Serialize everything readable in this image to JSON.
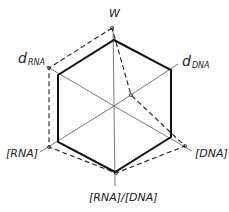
{
  "diagram": {
    "type": "hexagonal-radar",
    "center": [
      114,
      106
    ],
    "axes": [
      {
        "id": "w",
        "label": "W",
        "sub": "",
        "end": [
          113,
          26
        ],
        "hex": [
          114,
          40
        ],
        "dashed": [
          112,
          28
        ],
        "label_pos": [
          109,
          17
        ]
      },
      {
        "id": "d_dna",
        "label": "d",
        "sub": "DNA",
        "end": [
          178,
          64
        ],
        "hex": [
          171,
          70
        ],
        "dashed": [
          131,
          95
        ],
        "label_pos": [
          182,
          66
        ]
      },
      {
        "id": "dna",
        "label": "[DNA]",
        "sub": "",
        "end": [
          192,
          151
        ],
        "hex": [
          171,
          137
        ],
        "dashed": [
          185,
          146
        ],
        "label_pos": [
          195,
          157
        ]
      },
      {
        "id": "rna_dna",
        "label": "[RNA]/[DNA]",
        "sub": "",
        "end": [
          115,
          186
        ],
        "hex": [
          115,
          172
        ],
        "dashed": [
          116,
          173
        ],
        "label_pos": [
          89,
          201
        ]
      },
      {
        "id": "rna",
        "label": "[RNA]",
        "sub": "",
        "end": [
          40,
          152
        ],
        "hex": [
          58,
          142
        ],
        "dashed": [
          49,
          147
        ],
        "label_pos": [
          6,
          157
        ]
      },
      {
        "id": "d_rna",
        "label": "d",
        "sub": "RNA",
        "end": [
          46,
          66
        ],
        "hex": [
          58,
          75
        ],
        "dashed": [
          49,
          68
        ],
        "label_pos": [
          18,
          63
        ]
      }
    ],
    "dashed_order": [
      "w",
      "d_rna",
      "rna",
      "rna_dna",
      "dna",
      "d_dna"
    ],
    "colors": {
      "solid": "#111111",
      "axis": "#555555",
      "dashed": "#222222"
    }
  }
}
